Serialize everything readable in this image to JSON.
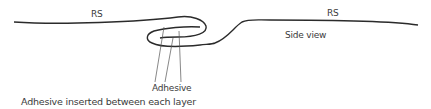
{
  "diagram": {
    "view": "Side view",
    "labels": {
      "rs_left": "RS",
      "rs_right": "RS",
      "side_view": "Side view",
      "adhesive": "Adhesive",
      "caption": "Adhesive inserted between each layer"
    },
    "colors": {
      "stroke": "#2b2b2b",
      "leader": "#555555",
      "text": "#3a3a3a"
    }
  }
}
